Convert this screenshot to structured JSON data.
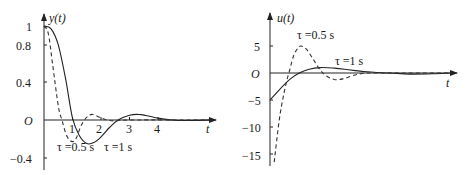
{
  "chart_data": [
    {
      "type": "line",
      "title": "",
      "ylabel": "y(t)",
      "xlabel": "t",
      "origin_label": "O",
      "x_ticks": [
        1,
        2,
        3,
        4
      ],
      "x_tick_labels": [
        "1",
        "2",
        "3",
        "4"
      ],
      "y_ticks": [
        1,
        0.8,
        0.4,
        -0.4
      ],
      "y_tick_labels": [
        "1",
        "0.8",
        "0.4",
        "−0.4"
      ],
      "xlim": [
        0,
        6
      ],
      "ylim": [
        -0.45,
        1.1
      ],
      "grid": false,
      "series": [
        {
          "name": "τ=1 s",
          "style": "solid",
          "x": [
            0,
            0.25,
            0.5,
            0.75,
            1.0,
            1.25,
            1.5,
            1.75,
            2.0,
            2.3,
            2.6,
            3.0,
            3.3,
            3.7,
            4.0,
            4.5,
            5.0,
            5.8
          ],
          "y": [
            1,
            0.97,
            0.8,
            0.45,
            0.02,
            -0.17,
            -0.25,
            -0.24,
            -0.18,
            -0.08,
            0.0,
            0.05,
            0.06,
            0.04,
            0.02,
            0.0,
            -0.005,
            0.0
          ]
        },
        {
          "name": "τ=0.5 s",
          "style": "dashed",
          "x": [
            0,
            0.15,
            0.3,
            0.5,
            0.63,
            0.8,
            1.0,
            1.15,
            1.3,
            1.5,
            1.7,
            1.95,
            2.2,
            2.5,
            3.0,
            5.8
          ],
          "y": [
            1,
            0.92,
            0.6,
            0.15,
            0.0,
            -0.17,
            -0.23,
            -0.18,
            -0.06,
            0.03,
            0.06,
            0.03,
            0.0,
            -0.01,
            0.0,
            0.0
          ]
        }
      ],
      "annotations": [
        {
          "text": "τ =0.5 s",
          "x": 0.65,
          "y": -0.33
        },
        {
          "text": "τ =1 s",
          "x": 2.35,
          "y": -0.33
        }
      ]
    },
    {
      "type": "line",
      "title": "",
      "ylabel": "u(t)",
      "xlabel": "t",
      "origin_label": "O",
      "x_ticks": [],
      "x_tick_labels": [],
      "y_ticks": [
        5,
        -5,
        -10,
        -15
      ],
      "y_tick_labels": [
        "5",
        "−5",
        "−10",
        "−15"
      ],
      "xlim": [
        0,
        6.6
      ],
      "ylim": [
        -17,
        10
      ],
      "grid": false,
      "series": [
        {
          "name": "τ=1 s",
          "style": "solid",
          "x": [
            0,
            0.25,
            0.5,
            0.75,
            1.05,
            1.4,
            1.8,
            2.3,
            2.8,
            3.3,
            3.8,
            4.3,
            5.0,
            5.8,
            6.5
          ],
          "y": [
            -5,
            -3.6,
            -2.2,
            -1.0,
            0.0,
            0.7,
            1.0,
            0.9,
            0.6,
            0.3,
            0.1,
            0.0,
            -0.2,
            -0.15,
            0.0
          ]
        },
        {
          "name": "τ=0.5 s",
          "style": "dashed",
          "x": [
            0.15,
            0.35,
            0.55,
            0.7,
            0.85,
            1.0,
            1.1,
            1.3,
            1.55,
            1.8,
            2.0,
            2.3,
            2.6,
            2.95,
            3.3,
            3.7,
            6.5
          ],
          "y": [
            -16.5,
            -8,
            -2.5,
            0.5,
            3.3,
            4.6,
            5.0,
            4.4,
            2.5,
            0.5,
            -0.5,
            -1.2,
            -1.1,
            -0.5,
            -0.1,
            0.0,
            0.0
          ]
        }
      ],
      "annotations": [
        {
          "text": "τ =0.5 s",
          "x": 1.0,
          "y": 7.0
        },
        {
          "text": "τ =1 s",
          "x": 2.5,
          "y": 2.4
        }
      ]
    }
  ],
  "left": {
    "ylabel": "y(t)",
    "xlabel": "t",
    "origin": "O",
    "yticks": [
      "1",
      "0.8",
      "0.4",
      "−0.4"
    ],
    "xticks": [
      "1",
      "2",
      "3",
      "4"
    ],
    "ann_fast": "τ =0.5 s",
    "ann_slow": "τ =1 s"
  },
  "right": {
    "ylabel": "u(t)",
    "xlabel": "t",
    "origin": "O",
    "yticks": [
      "5",
      "−5",
      "−10",
      "−15"
    ],
    "ann_fast": "τ =0.5 s",
    "ann_slow": "τ =1 s"
  }
}
